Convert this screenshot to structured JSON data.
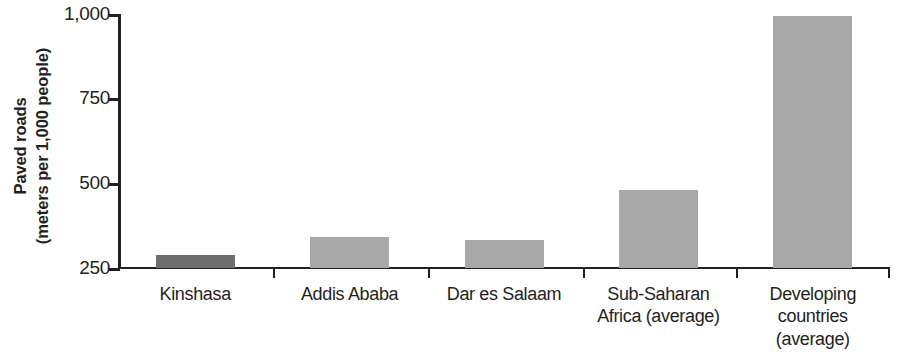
{
  "chart_data": {
    "type": "bar",
    "title": "",
    "subtitle": "",
    "xlabel": "",
    "ylabel": "Paved roads (meters per 1,000 people)",
    "ylabel_lines": [
      "Paved roads",
      "(meters per 1,000 people)"
    ],
    "categories": [
      "Kinshasa",
      "Addis Ababa",
      "Dar es Salaam",
      "Sub-Saharan Africa (average)",
      "Developing countries (average)"
    ],
    "category_lines": [
      [
        "Kinshasa"
      ],
      [
        "Addis Ababa"
      ],
      [
        "Dar es Salaam"
      ],
      [
        "Sub-Saharan",
        "Africa (average)"
      ],
      [
        "Developing",
        "countries",
        "(average)"
      ]
    ],
    "values": [
      288,
      341,
      332,
      480,
      995
    ],
    "ylim": [
      250,
      1000
    ],
    "yticks": [
      250,
      500,
      750,
      1000
    ],
    "ytick_labels": [
      "250",
      "500",
      "750",
      "1,000"
    ],
    "grid": false,
    "legend": "none",
    "bar_colors": [
      "#6e6e6e",
      "#a8a8a8",
      "#a8a8a8",
      "#a8a8a8",
      "#a8a8a8"
    ],
    "axis_color": "#231f20",
    "background_color": "#ffffff"
  }
}
